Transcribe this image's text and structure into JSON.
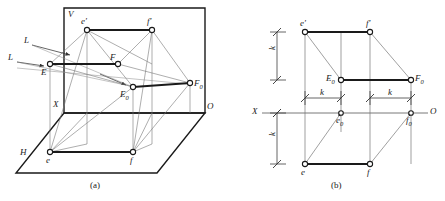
{
  "figure_a": {
    "caption": "(a)",
    "plane_labels": [
      {
        "name": "v-plane-label",
        "text": "V"
      },
      {
        "name": "h-plane-label",
        "text": "H"
      }
    ],
    "axis_labels": [
      {
        "name": "x-axis-label",
        "text": "X"
      },
      {
        "name": "o-origin-label",
        "text": "O"
      }
    ],
    "ray_labels": [
      {
        "name": "light-ray-label-upper",
        "text": "L"
      },
      {
        "name": "light-ray-label-lower",
        "text": "L"
      }
    ],
    "points": [
      {
        "name": "point-e-prime",
        "text": "e",
        "prime": "′",
        "sub": ""
      },
      {
        "name": "point-f-prime",
        "text": "f",
        "prime": "′",
        "sub": ""
      },
      {
        "name": "point-E",
        "text": "E",
        "prime": "",
        "sub": ""
      },
      {
        "name": "point-F",
        "text": "F",
        "prime": "",
        "sub": ""
      },
      {
        "name": "point-E0",
        "text": "E",
        "prime": "",
        "sub": "0"
      },
      {
        "name": "point-F0",
        "text": "F",
        "prime": "",
        "sub": "0"
      },
      {
        "name": "point-e",
        "text": "e",
        "prime": "",
        "sub": ""
      },
      {
        "name": "point-f",
        "text": "f",
        "prime": "",
        "sub": ""
      }
    ]
  },
  "figure_b": {
    "caption": "(b)",
    "axis_labels": [
      {
        "name": "x-axis-label",
        "text": "X"
      },
      {
        "name": "o-origin-label",
        "text": "O"
      }
    ],
    "points": [
      {
        "name": "point-e-prime",
        "text": "e",
        "prime": "′",
        "sub": ""
      },
      {
        "name": "point-f-prime",
        "text": "f",
        "prime": "′",
        "sub": ""
      },
      {
        "name": "point-E0",
        "text": "E",
        "prime": "",
        "sub": "0"
      },
      {
        "name": "point-F0",
        "text": "F",
        "prime": "",
        "sub": "0"
      },
      {
        "name": "point-e0",
        "text": "e",
        "prime": "",
        "sub": "0"
      },
      {
        "name": "point-f0",
        "text": "f",
        "prime": "",
        "sub": "0"
      },
      {
        "name": "point-e",
        "text": "e",
        "prime": "",
        "sub": ""
      },
      {
        "name": "point-f",
        "text": "f",
        "prime": "",
        "sub": ""
      }
    ],
    "dimensions": [
      {
        "name": "dim-k-upper-left",
        "text": "k"
      },
      {
        "name": "dim-k-lower-left",
        "text": "k"
      },
      {
        "name": "dim-k-horizontal-1",
        "text": "k"
      },
      {
        "name": "dim-k-horizontal-2",
        "text": "k"
      }
    ]
  },
  "colors": {
    "ink": "#1a1a1a",
    "thin_line": "#555555",
    "background": "#ffffff"
  }
}
